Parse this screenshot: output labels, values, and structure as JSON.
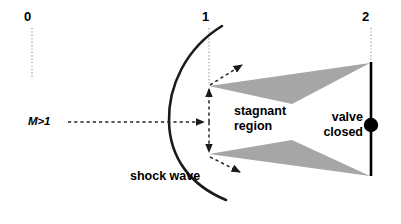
{
  "figure": {
    "background_color": "#ffffff",
    "width": 401,
    "height": 224
  },
  "colors": {
    "stroke": "#1a1a1a",
    "station_line": "#b3b3b3",
    "stagnant_fill": "#a6a6a6",
    "valve_line": "#000000",
    "dash": "#262626"
  },
  "stations": [
    {
      "id": "station-0",
      "label": "0",
      "x": 28,
      "line_x": 32,
      "line_top": 28,
      "line_bottom": 78
    },
    {
      "id": "station-1",
      "label": "1",
      "x": 205,
      "line_x": 209,
      "line_top": 28,
      "line_bottom": 92
    },
    {
      "id": "station-2",
      "label": "2",
      "x": 365,
      "line_x": 371,
      "line_top": 28,
      "line_bottom": 66
    }
  ],
  "annotations": {
    "mach_inflow": "M>1",
    "stagnant_region_line1": "stagnant",
    "stagnant_region_line2": "region",
    "valve_line1": "valve",
    "valve_line2": "closed",
    "shock_wave": "shock wave"
  },
  "elements": {
    "shock_wave_curve": "left-bowing arc from (222,26) through (170,122) to (226,200)",
    "upper_stagnant_triangle": "(209,86) (370,63) (292,104)",
    "lower_stagnant_triangle": "(209,154) (370,176) (292,140)",
    "valve_plate": "vertical line x=371 from y=62 to y=176",
    "valve_knob": "filled circle at (371,125) r=7",
    "inflow_arrow": "horizontal dashed arrow from (68,122) to (207,122)",
    "vertical_double_arrow": "dashed double-headed arrow x=209 from y=88 to y=153",
    "upper_deflect_arrow": "dashed arrow from (210,85) to (244,64)",
    "lower_deflect_arrow": "dashed arrow from (210,157) to (242,173)"
  }
}
